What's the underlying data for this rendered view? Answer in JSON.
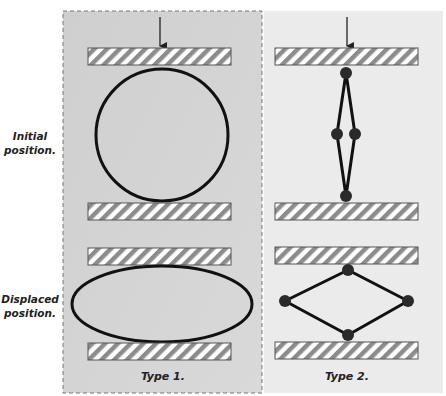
{
  "rows": [
    {
      "label_line1": "Initial",
      "label_line2": "position."
    },
    {
      "label_line1": "Displaced",
      "label_line2": "position."
    }
  ],
  "panels": [
    {
      "id": "type1",
      "label": "Type 1.",
      "background": "#d4d4d4",
      "border": "dashed"
    },
    {
      "id": "type2",
      "label": "Type 2.",
      "background": "#ebebeb",
      "border": "none"
    }
  ],
  "colors": {
    "outline": "#111111",
    "plate_stripe_dark": "#8c8c8c",
    "plate_stripe_light": "#ffffff",
    "plate_border": "#555555",
    "joint": "#2a2a2a"
  }
}
